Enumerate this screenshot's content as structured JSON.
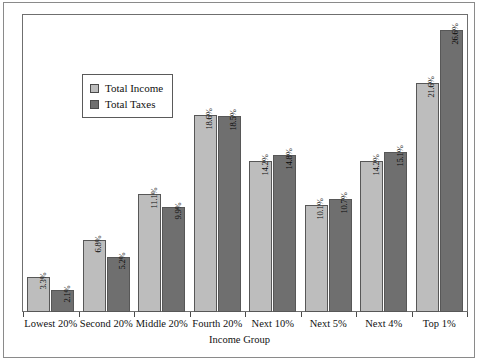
{
  "chart_data": {
    "type": "bar",
    "title": "",
    "xlabel": "Income Group",
    "ylabel": "Percentage Share of Income and Taxes",
    "ylim": [
      0,
      28
    ],
    "grid": false,
    "legend_position": "inside-upper-left",
    "categories": [
      "Lowest 20%",
      "Second 20%",
      "Middle 20%",
      "Fourth 20%",
      "Next 10%",
      "Next 5%",
      "Next 4%",
      "Top 1%"
    ],
    "series": [
      {
        "name": "Total Income",
        "color": "#bdbdbd",
        "values": [
          3.3,
          6.8,
          11.1,
          18.6,
          14.2,
          10.1,
          14.2,
          21.6
        ],
        "labels": [
          "3.3%",
          "6.8%",
          "11.1%",
          "18.6%",
          "14.2%",
          "10.1%",
          "14.2%",
          "21.6%"
        ]
      },
      {
        "name": "Total Taxes",
        "color": "#6f6f6f",
        "values": [
          2.1,
          5.2,
          9.9,
          18.5,
          14.8,
          10.7,
          15.1,
          26.6
        ],
        "labels": [
          "2.1%",
          "5.2%",
          "9.9%",
          "18.5%",
          "14.8%",
          "10.7%",
          "15.1%",
          "26.6%"
        ]
      }
    ]
  },
  "legend": {
    "items": [
      {
        "label": "Total Income",
        "swatch": "income"
      },
      {
        "label": "Total Taxes",
        "swatch": "taxes"
      }
    ]
  }
}
